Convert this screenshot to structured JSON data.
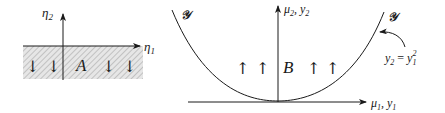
{
  "colors": {
    "stroke": "#1a1a1a",
    "hatch": "#b0b0b0",
    "shade_bg": "#e6e6e6",
    "background": "#ffffff"
  },
  "left_panel": {
    "region_label": "A",
    "axis_vertical": {
      "symbol": "η",
      "subscript": "2"
    },
    "axis_horizontal": {
      "symbol": "η",
      "subscript": "1"
    },
    "arrows": [
      "↓",
      "↓",
      "↓",
      "↓"
    ],
    "arrow_direction": "down",
    "shaded_region": "lower half-plane (η2 ≤ 0)"
  },
  "right_panel": {
    "region_label": "B",
    "axis_vertical": {
      "symbol": "μ",
      "subscript": "2",
      "extra": ", y",
      "extra_subscript": "2"
    },
    "axis_horizontal": {
      "symbol": "μ",
      "subscript": "1",
      "extra": ", y",
      "extra_subscript": "1"
    },
    "curve_label_left": "𝒴",
    "curve_label_right": "𝒴",
    "arrows": [
      "↑",
      "↑",
      "↑",
      "↑"
    ],
    "arrow_direction": "up",
    "annotation": {
      "lhs": "y",
      "lhs_sub": "2",
      "eq": " = ",
      "rhs": "y",
      "rhs_sub": "1",
      "rhs_sup": "2"
    }
  }
}
